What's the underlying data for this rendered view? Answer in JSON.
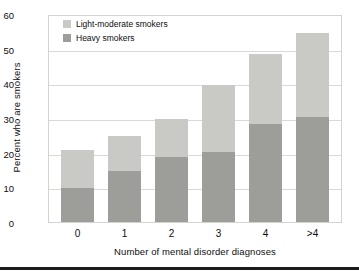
{
  "chart_data": {
    "type": "bar",
    "stacked": true,
    "title": "",
    "xlabel": "Number of mental disorder diagnoses",
    "ylabel": "Percent who are smokers",
    "categories": [
      "0",
      "1",
      "2",
      "3",
      "4",
      ">4"
    ],
    "ylim": [
      0,
      60
    ],
    "yticks": [
      0,
      10,
      20,
      30,
      40,
      50,
      60
    ],
    "ytick_labels": [
      "0",
      "10",
      "20",
      "30",
      "40",
      "50",
      "60"
    ],
    "grid": true,
    "grid_axis": "y",
    "legend_position": "upper left",
    "series": [
      {
        "name": "Heavy smokers",
        "color": "#9d9d99",
        "values": [
          10,
          15,
          19,
          20.5,
          28.5,
          30.5
        ]
      },
      {
        "name": "Light-moderate smokers",
        "color": "#c9c9c5",
        "values": [
          11,
          10,
          11,
          19.5,
          20.5,
          24.5
        ]
      }
    ],
    "totals": [
      21,
      25,
      30,
      40,
      49,
      55
    ],
    "legend_order": [
      "Light-moderate smokers",
      "Heavy smokers"
    ]
  },
  "legend": {
    "items": [
      {
        "label": "Light-moderate smokers",
        "color": "#c9c9c5"
      },
      {
        "label": "Heavy smokers",
        "color": "#9d9d99"
      }
    ]
  },
  "colors": {
    "light_moderate": "#c9c9c5",
    "heavy": "#9d9d99",
    "grid": "#d9d9d7",
    "frame": "#d3d3d1",
    "text": "#0e0e0e",
    "rule": "#1b1b1b"
  }
}
